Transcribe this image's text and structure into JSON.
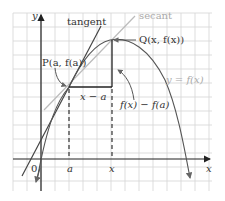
{
  "diagram": {
    "axes": {
      "x_label": "x",
      "y_label": "y",
      "origin_label": "0"
    },
    "tick_labels": {
      "a": "a",
      "x": "x"
    },
    "labels": {
      "tangent": "tangent",
      "secant": "secant",
      "point_p": "P(a, f(a))",
      "point_q": "Q(x, f(x))",
      "curve": "y = f(x)",
      "run": "x − a",
      "rise": "f(x) − f(a)"
    },
    "colors": {
      "curve": "#555555",
      "tangent": "#444444",
      "secant": "#bbbbbb",
      "grid": "#d4d4d4",
      "axes": "#222222"
    }
  }
}
